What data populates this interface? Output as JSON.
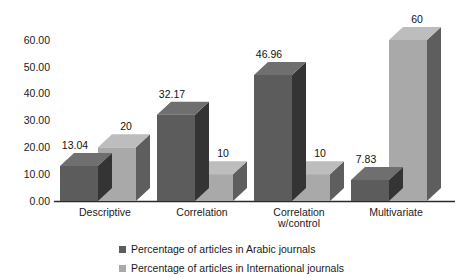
{
  "chart_data": {
    "type": "bar",
    "title": "",
    "subtitle": "",
    "xlabel": "",
    "ylabel": "",
    "categories": [
      "Descriptive",
      "Correlation",
      "Correlation\nw/control",
      "Multivariate"
    ],
    "category_lines": [
      [
        "Descriptive"
      ],
      [
        "Correlation"
      ],
      [
        "Correlation",
        "w/control"
      ],
      [
        "Multivariate"
      ]
    ],
    "series": [
      {
        "name": "Percentage of articles in Arabic journals",
        "values": [
          13.04,
          32.17,
          46.96,
          7.83
        ],
        "labels": [
          "13.04",
          "32.17",
          "46.96",
          "7.83"
        ],
        "color": "#5c5c5c",
        "color_top": "#6f6f6f",
        "color_side": "#343434"
      },
      {
        "name": "Percentage of articles in International  journals",
        "values": [
          20,
          10,
          10,
          60
        ],
        "labels": [
          "20",
          "10",
          "10",
          "60"
        ],
        "color": "#a9a9a9",
        "color_top": "#bdbdbd",
        "color_side": "#5e5e5e"
      }
    ],
    "ylim": [
      0,
      60
    ],
    "yticks": [
      0,
      10,
      20,
      30,
      40,
      50,
      60
    ],
    "ytick_labels": [
      "0.00",
      "10.00",
      "20.00",
      "30.00",
      "40.00",
      "50.00",
      "60.00"
    ],
    "grid": false,
    "legend_position": "bottom",
    "style": "3d-clustered-column",
    "background": "#ffffff",
    "axis_color": "#2b2b2b",
    "text_color": "#1a1a1a"
  },
  "legend": {
    "entries": [
      {
        "label": "Percentage of articles in Arabic journals",
        "swatch": "#5c5c5c"
      },
      {
        "label": "Percentage of articles in International  journals",
        "swatch": "#a9a9a9"
      }
    ]
  }
}
